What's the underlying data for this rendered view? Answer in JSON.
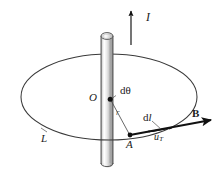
{
  "figure": {
    "type": "physics-diagram",
    "background_color": "#ffffff",
    "ink_color": "#1a1a1a",
    "labels": {
      "current": "I",
      "center": "O",
      "angle_element": "dθ",
      "radius": "r",
      "point_on_loop": "A",
      "length_element_d": "d",
      "length_element_l": "l",
      "unit_tangent_u": "u",
      "unit_tangent_sub": "T",
      "field": "B",
      "loop": "L"
    },
    "elements": [
      {
        "name": "current-arrow",
        "label": "I",
        "direction": "up",
        "description": "vertical arrow above the rod indicating current direction"
      },
      {
        "name": "conductor-rod",
        "label": "",
        "description": "vertical cylinder representing the straight current-carrying wire"
      },
      {
        "name": "amperian-loop",
        "label": "L",
        "description": "horizontal circle seen in perspective as an ellipse"
      },
      {
        "name": "center-point",
        "label": "O",
        "description": "center of the circular loop on the wire axis"
      },
      {
        "name": "angle-element",
        "label": "dθ",
        "description": "infinitesimal angle at the center subtended by dl"
      },
      {
        "name": "radius-line",
        "label": "r",
        "description": "radius from center O to point A on the loop"
      },
      {
        "name": "loop-point",
        "label": "A",
        "description": "point on the loop where the line element is taken"
      },
      {
        "name": "length-element-arrow",
        "label": "dl",
        "description": "infinitesimal vector line element tangent to the loop at A"
      },
      {
        "name": "unit-tangent-arrow",
        "label": "uT",
        "description": "unit tangent vector at point A"
      },
      {
        "name": "field-vector-arrow",
        "label": "B",
        "description": "magnetic flux density vector tangent to the loop at A"
      }
    ],
    "geometry": {
      "loop_center": [
        109,
        97
      ],
      "loop_rx": 88,
      "loop_ry": 43,
      "rod_center_x": 107,
      "rod_top_y": 30,
      "rod_bottom_y": 168,
      "rod_width": 12,
      "point_A": [
        130,
        135
      ],
      "current_arrow": {
        "x": 131,
        "y_top": 9,
        "y_bottom": 45
      }
    }
  }
}
